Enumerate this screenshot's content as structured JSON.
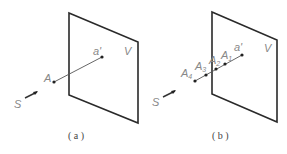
{
  "panels": [
    {
      "id": "a",
      "caption": "( a )",
      "plane_label": "V",
      "source_label": "S",
      "points": [
        {
          "label": "A",
          "sub": ""
        },
        {
          "label": "a'",
          "sub": ""
        }
      ]
    },
    {
      "id": "b",
      "caption": "( b )",
      "plane_label": "V",
      "source_label": "S",
      "points": [
        {
          "label": "A",
          "sub": "4"
        },
        {
          "label": "A",
          "sub": "3"
        },
        {
          "label": "A",
          "sub": "2"
        },
        {
          "label": "A",
          "sub": "1"
        },
        {
          "label": "a'",
          "sub": ""
        }
      ]
    }
  ],
  "colors": {
    "plane": "#2a2a2a",
    "label": "#888888"
  }
}
